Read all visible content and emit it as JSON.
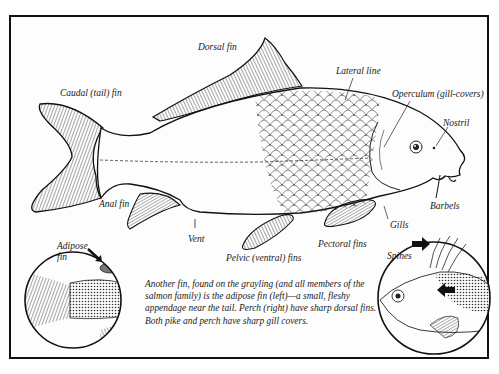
{
  "figure": {
    "labels": {
      "dorsal_fin": "Dorsal fin",
      "caudal_fin": "Caudal (tail) fin",
      "lateral_line": "Lateral line",
      "operculum": "Operculum (gill-covers)",
      "nostril": "Nostril",
      "anal_fin": "Anal fin",
      "vent": "Vent",
      "barbels": "Barbels",
      "gills": "Gills",
      "pectoral_fins": "Pectoral fins",
      "pelvic_fins": "Pelvic (ventral) fins",
      "adipose_fin": "Adipose fin",
      "adipose_fin_line1": "Adipose",
      "adipose_fin_line2": "fin",
      "spines": "Spines"
    },
    "caption": "Another fin, found on the grayling (and all members of the salmon family) is the adipose fin (left)—a small, fleshy appendage near the tail. Perch (right) have sharp dorsal fins. Both pike and perch have sharp gill covers.",
    "insets": [
      {
        "name": "grayling-tail-inset",
        "shows": "Adipose fin",
        "icon": "arrow-icon"
      },
      {
        "name": "perch-head-inset",
        "shows": "Spines",
        "icon": "arrow-icon"
      }
    ],
    "colors": {
      "ink": "#1a1a1a",
      "paper": "#fdfdfd",
      "frame": "#111111"
    }
  }
}
